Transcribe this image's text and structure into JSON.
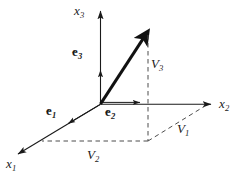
{
  "figure": {
    "name": "vector-decomposition-diagram",
    "type": "3d-cartesian-vector-diagram",
    "background_color": "#ffffff",
    "stroke_color": "#1a1a1a",
    "dashed_color": "#555555",
    "width": 241,
    "height": 177
  },
  "axes": [
    {
      "id": "x3",
      "label_base": "x",
      "label_sub": "3",
      "direction": "up",
      "label_x": 74,
      "label_y": 4
    },
    {
      "id": "x2",
      "label_base": "x",
      "label_sub": "2",
      "direction": "right",
      "label_x": 219,
      "label_y": 97
    },
    {
      "id": "x1",
      "label_base": "x",
      "label_sub": "1",
      "direction": "down-left",
      "label_x": 6,
      "label_y": 157
    }
  ],
  "unit_vectors": [
    {
      "id": "e1",
      "label_base": "e",
      "label_sub": "1",
      "hat": "‸",
      "label_x": 46,
      "label_y": 104
    },
    {
      "id": "e2",
      "label_base": "e",
      "label_sub": "2",
      "hat": "‸",
      "label_x": 105,
      "label_y": 105
    },
    {
      "id": "e3",
      "label_base": "e",
      "label_sub": "3",
      "hat": "‸",
      "label_x": 72,
      "label_y": 45
    }
  ],
  "components": [
    {
      "id": "V1",
      "label_base": "V",
      "label_sub": "1",
      "label_x": 177,
      "label_y": 122
    },
    {
      "id": "V2",
      "label_base": "V",
      "label_sub": "2",
      "label_x": 87,
      "label_y": 148
    },
    {
      "id": "V3",
      "label_base": "V",
      "label_sub": "3",
      "label_x": 151,
      "label_y": 57
    }
  ],
  "geometry": {
    "origin": {
      "x": 100,
      "y": 104
    },
    "vector_tip": {
      "x": 148,
      "y": 31
    },
    "x2_axis_end": {
      "x": 214,
      "y": 104
    },
    "x3_axis_end": {
      "x": 100,
      "y": 9
    },
    "x1_axis_end": {
      "x": 15,
      "y": 156
    },
    "projection_point": {
      "x": 148,
      "y": 141
    },
    "x1_foot": {
      "x": 42,
      "y": 141
    },
    "x2_foot": {
      "x": 203,
      "y": 104
    }
  }
}
